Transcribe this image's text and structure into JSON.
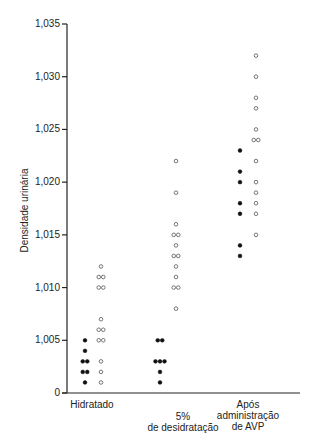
{
  "chart_data": {
    "type": "scatter",
    "title": "",
    "xlabel": "",
    "ylabel": "Densidade urinária",
    "ylim": [
      1.0,
      1.035
    ],
    "yticks": [
      "0",
      "1,005",
      "1,010",
      "1,015",
      "1,020",
      "1,025",
      "1,030",
      "1,035"
    ],
    "ytick_values": [
      1.0,
      1.005,
      1.01,
      1.015,
      1.02,
      1.025,
      1.03,
      1.035
    ],
    "grid": false,
    "legend": null,
    "categories": [
      "Hidratado",
      "5% de desidratação",
      "Após administração de AVP"
    ],
    "category_labels": [
      [
        "Hidratado"
      ],
      [
        "5%",
        "de desidratação"
      ],
      [
        "Após",
        "administração",
        "de AVP"
      ]
    ],
    "series": [
      {
        "name": "filled",
        "marker": "filled-circle",
        "color": "#111111",
        "points": [
          {
            "category": 0,
            "values": [
              1.005,
              1.004,
              1.003,
              1.003,
              1.002,
              1.002,
              1.001
            ]
          },
          {
            "category": 1,
            "values": [
              1.005,
              1.005,
              1.003,
              1.003,
              1.003,
              1.002,
              1.001
            ]
          },
          {
            "category": 2,
            "values": [
              1.023,
              1.021,
              1.02,
              1.018,
              1.017,
              1.014,
              1.013
            ]
          }
        ]
      },
      {
        "name": "open",
        "marker": "open-circle",
        "color": "#555555",
        "points": [
          {
            "category": 0,
            "values": [
              1.012,
              1.011,
              1.011,
              1.01,
              1.01,
              1.007,
              1.006,
              1.006,
              1.005,
              1.005,
              1.003,
              1.002,
              1.001
            ]
          },
          {
            "category": 1,
            "values": [
              1.022,
              1.019,
              1.016,
              1.015,
              1.015,
              1.014,
              1.013,
              1.013,
              1.012,
              1.011,
              1.01,
              1.01,
              1.008
            ]
          },
          {
            "category": 2,
            "values": [
              1.032,
              1.03,
              1.028,
              1.027,
              1.025,
              1.024,
              1.024,
              1.022,
              1.02,
              1.019,
              1.018,
              1.017,
              1.015
            ]
          }
        ]
      }
    ]
  }
}
